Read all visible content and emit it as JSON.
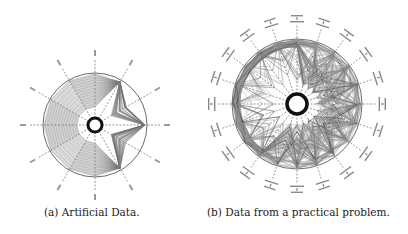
{
  "figure": {
    "subfigures": [
      {
        "label": "(a)",
        "caption": "(a) Artificial Data."
      },
      {
        "label": "(b)",
        "caption": "(b) Data from a practical problem."
      }
    ]
  },
  "chart_data": [
    {
      "type": "radar",
      "title": "(a) Artificial Data.",
      "num_axes": 12,
      "axis_angle_step_deg": 30,
      "axis_labels_legible": false,
      "style": {
        "line_color": "#555555",
        "fill_shading": "#bbbbbb",
        "hub_ring_color": "#111111",
        "axis_dash": true
      },
      "notes": "Many concentric polygon-like polylines forming nested rings; on the right half the lines form star-shaped spikes that reach out to the outer circle near the 0° axis."
    },
    {
      "type": "radar",
      "title": "(b) Data from a practical problem.",
      "num_axes": 20,
      "axis_angle_step_deg": 18,
      "axis_labels_legible": false,
      "style": {
        "line_color": "#666666",
        "hub_ring_color": "#111111",
        "axis_dash": true
      },
      "notes": "Dense set of polylines; most lie near the outer circle, many spikes toward the hub on the right and lower-right axes."
    }
  ]
}
